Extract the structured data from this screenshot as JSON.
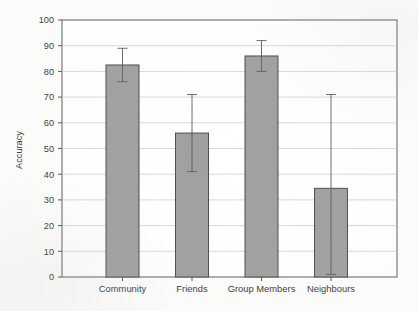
{
  "chart_data": {
    "type": "bar",
    "title": "",
    "xlabel": "",
    "ylabel": "Accuracy",
    "categories": [
      "Community",
      "Friends",
      "Group Members",
      "Neighbours"
    ],
    "values": [
      82.5,
      56,
      86,
      34.5
    ],
    "error_upper": [
      89,
      71,
      92,
      71
    ],
    "error_lower": [
      76,
      41,
      80,
      1
    ],
    "ylim": [
      0,
      100
    ],
    "ytick_labels": [
      "0",
      "10",
      "20",
      "30",
      "40",
      "50",
      "60",
      "70",
      "80",
      "90",
      "100"
    ],
    "ytick_values": [
      0,
      10,
      20,
      30,
      40,
      50,
      60,
      70,
      80,
      90,
      100
    ],
    "grid": true,
    "grid_axis": "y",
    "legend": "none",
    "bar_color": "#a0a0a0",
    "bar_edge_color": "#4d4d4d",
    "error_bar_color": "#5a5a5a",
    "axis_color": "#555555",
    "grid_color": "#c9c9c9",
    "background_color": "#fdfdfc"
  },
  "axes": {
    "y_axis_title": "Accuracy"
  }
}
